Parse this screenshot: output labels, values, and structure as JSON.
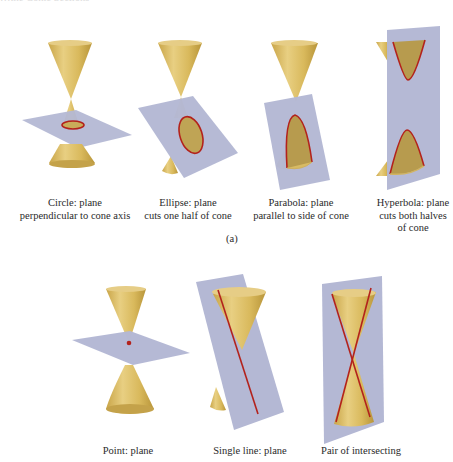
{
  "figure": {
    "header_fragment": "…the Conic Sections",
    "row_a_label": "(a)",
    "colors": {
      "cone": "#d9b95c",
      "cone_dark": "#b8953a",
      "cone_light": "#ecd58e",
      "plane": "#b4b8d4",
      "curve": "#b3221c"
    },
    "row_a": [
      {
        "id": "circle",
        "caption_line1": "Circle: plane",
        "caption_line2": "perpendicular to cone axis",
        "caption_line3": ""
      },
      {
        "id": "ellipse",
        "caption_line1": "Ellipse: plane",
        "caption_line2": "cuts one half of cone",
        "caption_line3": ""
      },
      {
        "id": "parabola",
        "caption_line1": "Parabola: plane",
        "caption_line2": "parallel to side of cone",
        "caption_line3": ""
      },
      {
        "id": "hyperbola",
        "caption_line1": "Hyperbola: plane",
        "caption_line2": "cuts both halves",
        "caption_line3": "of cone"
      }
    ],
    "row_b": [
      {
        "id": "point",
        "caption_line1": "Point: plane"
      },
      {
        "id": "single-line",
        "caption_line1": "Single line: plane"
      },
      {
        "id": "intersecting-lines",
        "caption_line1": "Pair of intersecting"
      }
    ]
  }
}
